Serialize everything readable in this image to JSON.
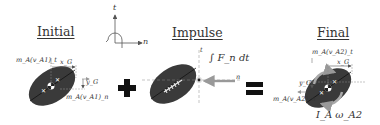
{
  "panels": {
    "initial": {
      "title": "Initial",
      "labels": {
        "momentum_t": "m_A(v_A1)_t",
        "momentum_n": "m_A(v_A1)_n",
        "x_offset": "x_G",
        "y_offset": "y_G"
      }
    },
    "impulse": {
      "title": "Impulse",
      "labels": {
        "impulse": "∫ F_n dt",
        "axis_t": "t",
        "axis_n": "n"
      }
    },
    "final": {
      "title": "Final",
      "labels": {
        "momentum_t": "m_A(v_A2)_t",
        "momentum_n": "m_A(v_A2)_n",
        "x_offset": "x_G",
        "y_offset": "y_G",
        "angular": "I_A ω_A2"
      }
    }
  },
  "axes": {
    "t_label": "t",
    "n_label": "n"
  },
  "operators": {
    "plus": "+",
    "equals": "="
  },
  "colors": {
    "ball": "#3a3a3a",
    "arrow": "#999999",
    "text": "#333333",
    "rotation": "#aaaaaa"
  }
}
